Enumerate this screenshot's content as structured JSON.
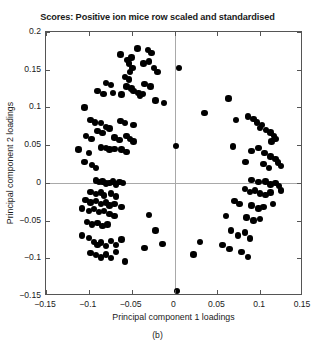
{
  "chart_data": {
    "type": "scatter",
    "title": "Scores: Positive ion mice row scaled and standardised",
    "xlabel": "Principal component 1 loadings",
    "ylabel": "Principal component 2 loadings",
    "caption": "(b)",
    "xlim": [
      -0.15,
      0.15
    ],
    "ylim": [
      -0.15,
      0.2
    ],
    "xticks": [
      -0.15,
      -0.1,
      -0.05,
      0,
      0.05,
      0.1,
      0.15
    ],
    "yticks": [
      0.2,
      0.15,
      0.1,
      0.05,
      0,
      -0.05,
      -0.1,
      -0.15
    ],
    "xticklabels": [
      "−0.15",
      "−0.1",
      "−0.05",
      "0",
      "0.05",
      "0.1",
      "0.15"
    ],
    "yticklabels": [
      "0.2",
      "0.15",
      "0.1",
      "0.05",
      "0",
      "−0.05",
      "−0.1",
      "−0.15"
    ],
    "grid": false,
    "legend": null,
    "marker": "filled-circle",
    "marker_color": "#000000",
    "marker_size_px": 6.4,
    "reference_lines": [
      {
        "orientation": "vertical",
        "value": 0,
        "color": "#a9a9a9"
      },
      {
        "orientation": "horizontal",
        "value": 0,
        "color": "#a9a9a9"
      }
    ],
    "n_points": 160,
    "series": [
      {
        "name": "scores",
        "points": [
          [
            0.005,
            0.152
          ],
          [
            -0.043,
            0.178
          ],
          [
            -0.031,
            0.176
          ],
          [
            -0.027,
            0.172
          ],
          [
            -0.063,
            0.17
          ],
          [
            -0.055,
            0.163
          ],
          [
            -0.05,
            0.166
          ],
          [
            -0.053,
            0.158
          ],
          [
            -0.049,
            0.152
          ],
          [
            -0.052,
            0.147
          ],
          [
            -0.036,
            0.158
          ],
          [
            -0.03,
            0.161
          ],
          [
            -0.024,
            0.152
          ],
          [
            -0.02,
            0.147
          ],
          [
            -0.058,
            0.14
          ],
          [
            -0.053,
            0.137
          ],
          [
            -0.08,
            0.132
          ],
          [
            -0.074,
            0.13
          ],
          [
            -0.056,
            0.128
          ],
          [
            -0.05,
            0.125
          ],
          [
            -0.035,
            0.131
          ],
          [
            -0.028,
            0.128
          ],
          [
            -0.09,
            0.122
          ],
          [
            -0.083,
            0.118
          ],
          [
            -0.072,
            0.119
          ],
          [
            -0.062,
            0.117
          ],
          [
            -0.048,
            0.122
          ],
          [
            -0.042,
            0.119
          ],
          [
            -0.04,
            0.115
          ],
          [
            -0.037,
            0.118
          ],
          [
            -0.022,
            0.109
          ],
          [
            -0.012,
            0.106
          ],
          [
            -0.105,
            0.1
          ],
          [
            -0.098,
            0.083
          ],
          [
            -0.093,
            0.08
          ],
          [
            -0.086,
            0.079
          ],
          [
            -0.08,
            0.074
          ],
          [
            -0.076,
            0.072
          ],
          [
            -0.09,
            0.069
          ],
          [
            -0.084,
            0.066
          ],
          [
            -0.063,
            0.082
          ],
          [
            -0.058,
            0.079
          ],
          [
            -0.048,
            0.077
          ],
          [
            -0.07,
            0.06
          ],
          [
            -0.064,
            0.057
          ],
          [
            -0.056,
            0.062
          ],
          [
            -0.052,
            0.058
          ],
          [
            -0.048,
            0.055
          ],
          [
            -0.103,
            0.062
          ],
          [
            -0.097,
            0.058
          ],
          [
            -0.112,
            0.044
          ],
          [
            -0.1,
            0.04
          ],
          [
            -0.086,
            0.047
          ],
          [
            -0.08,
            0.046
          ],
          [
            -0.076,
            0.044
          ],
          [
            -0.07,
            0.045
          ],
          [
            -0.062,
            0.044
          ],
          [
            -0.056,
            0.041
          ],
          [
            -0.105,
            0.028
          ],
          [
            -0.096,
            0.024
          ],
          [
            -0.092,
            0.02
          ],
          [
            0.002,
            0.049
          ],
          [
            -0.092,
            0.003
          ],
          [
            -0.088,
            0.001
          ],
          [
            -0.084,
            0.002
          ],
          [
            -0.08,
            -0.001
          ],
          [
            -0.076,
            0.0
          ],
          [
            -0.072,
            0.002
          ],
          [
            -0.068,
            -0.002
          ],
          [
            -0.064,
            0.001
          ],
          [
            -0.06,
            0.0
          ],
          [
            -0.098,
            -0.012
          ],
          [
            -0.092,
            -0.015
          ],
          [
            -0.086,
            -0.013
          ],
          [
            -0.082,
            -0.017
          ],
          [
            -0.074,
            -0.014
          ],
          [
            -0.068,
            -0.018
          ],
          [
            -0.104,
            -0.023
          ],
          [
            -0.098,
            -0.026
          ],
          [
            -0.092,
            -0.024
          ],
          [
            -0.086,
            -0.028
          ],
          [
            -0.08,
            -0.026
          ],
          [
            -0.076,
            -0.03
          ],
          [
            -0.07,
            -0.028
          ],
          [
            -0.062,
            -0.032
          ],
          [
            -0.108,
            -0.034
          ],
          [
            -0.1,
            -0.037
          ],
          [
            -0.094,
            -0.035
          ],
          [
            -0.088,
            -0.039
          ],
          [
            -0.082,
            -0.037
          ],
          [
            -0.076,
            -0.041
          ],
          [
            -0.07,
            -0.044
          ],
          [
            -0.102,
            -0.052
          ],
          [
            -0.096,
            -0.055
          ],
          [
            -0.09,
            -0.053
          ],
          [
            -0.084,
            -0.057
          ],
          [
            -0.078,
            -0.055
          ],
          [
            -0.03,
            -0.043
          ],
          [
            -0.022,
            -0.063
          ],
          [
            -0.108,
            -0.07
          ],
          [
            -0.1,
            -0.073
          ],
          [
            -0.094,
            -0.078
          ],
          [
            -0.09,
            -0.082
          ],
          [
            -0.086,
            -0.079
          ],
          [
            -0.08,
            -0.084
          ],
          [
            -0.074,
            -0.077
          ],
          [
            -0.068,
            -0.082
          ],
          [
            -0.062,
            -0.075
          ],
          [
            -0.098,
            -0.093
          ],
          [
            -0.092,
            -0.096
          ],
          [
            -0.086,
            -0.099
          ],
          [
            -0.08,
            -0.095
          ],
          [
            -0.074,
            -0.1
          ],
          [
            -0.068,
            -0.092
          ],
          [
            -0.058,
            -0.104
          ],
          [
            -0.035,
            -0.086
          ],
          [
            -0.014,
            -0.081
          ],
          [
            0.035,
            0.093
          ],
          [
            0.063,
            0.112
          ],
          [
            0.072,
            0.083
          ],
          [
            0.086,
            0.088
          ],
          [
            0.092,
            0.085
          ],
          [
            0.096,
            0.08
          ],
          [
            0.102,
            0.077
          ],
          [
            0.1,
            0.073
          ],
          [
            0.107,
            0.07
          ],
          [
            0.112,
            0.067
          ],
          [
            0.116,
            0.062
          ],
          [
            0.118,
            0.058
          ],
          [
            0.113,
            0.055
          ],
          [
            0.068,
            0.048
          ],
          [
            0.09,
            0.042
          ],
          [
            0.098,
            0.046
          ],
          [
            0.105,
            0.04
          ],
          [
            0.112,
            0.035
          ],
          [
            0.118,
            0.032
          ],
          [
            0.121,
            0.027
          ],
          [
            0.124,
            0.022
          ],
          [
            0.104,
            0.025
          ],
          [
            0.11,
            0.02
          ],
          [
            0.083,
            0.028
          ],
          [
            0.09,
            0.004
          ],
          [
            0.098,
            0.001
          ],
          [
            0.106,
            0.002
          ],
          [
            0.112,
            -0.002
          ],
          [
            0.118,
            0.0
          ],
          [
            0.122,
            -0.004
          ],
          [
            0.124,
            -0.01
          ],
          [
            0.082,
            -0.008
          ],
          [
            0.088,
            -0.012
          ],
          [
            0.094,
            -0.01
          ],
          [
            0.1,
            -0.014
          ],
          [
            0.106,
            -0.016
          ],
          [
            0.112,
            -0.013
          ],
          [
            0.07,
            -0.024
          ],
          [
            0.076,
            -0.028
          ],
          [
            0.09,
            -0.03
          ],
          [
            0.098,
            -0.034
          ],
          [
            0.104,
            -0.032
          ],
          [
            0.115,
            -0.028
          ],
          [
            0.06,
            -0.044
          ],
          [
            0.084,
            -0.046
          ],
          [
            0.092,
            -0.05
          ],
          [
            0.1,
            -0.048
          ],
          [
            0.066,
            -0.063
          ],
          [
            0.074,
            -0.07
          ],
          [
            0.082,
            -0.066
          ],
          [
            0.088,
            -0.074
          ],
          [
            0.056,
            -0.082
          ],
          [
            0.064,
            -0.088
          ],
          [
            0.078,
            -0.092
          ],
          [
            0.086,
            -0.098
          ],
          [
            0.03,
            -0.078
          ],
          [
            0.022,
            -0.095
          ],
          [
            0.003,
            -0.143
          ]
        ]
      }
    ]
  }
}
